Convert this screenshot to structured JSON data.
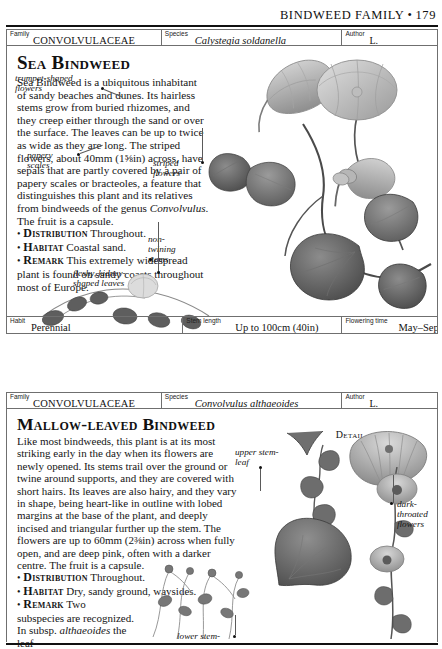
{
  "running_head": {
    "text": "BINDWEED FAMILY",
    "separator": "•",
    "page_number": "179"
  },
  "entries": [
    {
      "header": {
        "family_label": "Family",
        "family_value": "CONVOLVULACEAE",
        "species_label": "Species",
        "species_value": "Calystegia soldanella",
        "author_label": "Author",
        "author_value": "L."
      },
      "title": "Sea Bindweed",
      "paragraph": "Sea Bindweed is a ubiquitous inhabitant of sandy beaches and dunes. Its hairless stems grow from buried rhizomes, and they creep either through the sand or over the surface. The leaves can be up to twice as wide as they are long. The striped flowers, about 40mm (1⅝in) across, have sepals that are partly covered by a pair of papery scales or bracteoles, a feature that distinguishes this plant and its relatives from bindweeds of the genus ",
      "paragraph_italic": "Convolvulus",
      "paragraph_tail": ". The fruit is a capsule.",
      "facts": [
        {
          "bullet": "•",
          "keyword": "Distribution",
          "value": "Throughout."
        },
        {
          "bullet": "•",
          "keyword": "Habitat",
          "value": "Coastal sand."
        },
        {
          "bullet": "•",
          "keyword": "Remark",
          "value": "This extremely widespread plant is found on sandy coasts throughout most of Europe."
        }
      ],
      "callouts": [
        {
          "name": "trumpet-shaped-flowers",
          "text": "trumpet-shaped\nflowers"
        },
        {
          "name": "papery-scales",
          "text": "papery\nscales"
        },
        {
          "name": "striped-flowers",
          "text": "striped\nflowers"
        },
        {
          "name": "non-twining-stems",
          "text": "non-\ntwining\nstems"
        },
        {
          "name": "fleshy-kidney-shaped-leaves",
          "text": "fleshy, kidney-\nshaped leaves"
        }
      ],
      "data_strip": {
        "habit_label": "Habit",
        "habit_value": "Perennial",
        "stem_label": "Stem length",
        "stem_value": "Up to 100cm (40in)",
        "flowering_label": "Flowering time",
        "flowering_value": "May–Sept"
      }
    },
    {
      "header": {
        "family_label": "Family",
        "family_value": "CONVOLVULACEAE",
        "species_label": "Species",
        "species_value": "Convolvulus althaeoides",
        "author_label": "Author",
        "author_value": "L."
      },
      "title": "Mallow-leaved Bindweed",
      "detail_tag": "Detail",
      "paragraph": "Like most bindweeds, this plant is at its most striking early in the day when its flowers are newly opened. Its stems trail over the ground or twine around supports, and they are covered with short hairs. Its leaves are also hairy, and they vary in shape, being heart-like in outline with lobed margins at the base of the plant, and deeply incised and triangular further up the stem. The flowers are up to 60mm (2⅜in) across when fully open, and are deep pink, often with a darker centre. The fruit is a capsule.",
      "facts": [
        {
          "bullet": "•",
          "keyword": "Distribution",
          "value": "Throughout."
        },
        {
          "bullet": "•",
          "keyword": "Habitat",
          "value": "Dry, sandy ground, waysides."
        },
        {
          "bullet": "•",
          "keyword": "Remark",
          "value": "Two subspecies are recognized. In subsp. "
        }
      ],
      "remark_italic": "althaeoides",
      "remark_tail": " the leaf-",
      "callouts": [
        {
          "name": "upper-stem-leaf",
          "text": "upper stem-\nleaf"
        },
        {
          "name": "dark-throated-flowers",
          "text": "dark-\nthroated\nflowers"
        },
        {
          "name": "lower-stem-leaf",
          "text": "lower stem-"
        }
      ]
    }
  ],
  "colors": {
    "rule": "#111111",
    "cell_border": "#6f6f6f",
    "text": "#151515",
    "artwork_ink": "#6b6b6b"
  }
}
